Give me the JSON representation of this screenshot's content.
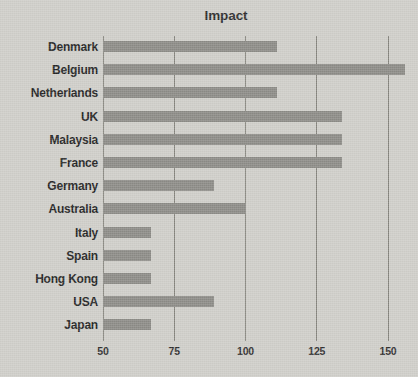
{
  "chart_data": {
    "type": "bar",
    "orientation": "horizontal",
    "title": "Impact",
    "xlabel": "",
    "ylabel": "",
    "xlim": [
      50,
      157
    ],
    "xticks": [
      50,
      75,
      100,
      125,
      150
    ],
    "xtick_labels": [
      "50",
      "75",
      "100",
      "125",
      "150"
    ],
    "grid": true,
    "grid_axis": "x",
    "legend": false,
    "bar_color": "#8b8a85",
    "background_color": "#cecdc8",
    "gridline_color": "#77766f",
    "text_color": "#232323",
    "categories": [
      "Denmark",
      "Belgium",
      "Netherlands",
      "UK",
      "Malaysia",
      "France",
      "Germany",
      "Australia",
      "Italy",
      "Spain",
      "Hong Kong",
      "USA",
      "Japan"
    ],
    "values": [
      111,
      156,
      111,
      134,
      134,
      134,
      89,
      100,
      67,
      67,
      67,
      89,
      67
    ],
    "bars": [
      {
        "label": "Denmark",
        "value": 111
      },
      {
        "label": "Belgium",
        "value": 156
      },
      {
        "label": "Netherlands",
        "value": 111
      },
      {
        "label": "UK",
        "value": 134
      },
      {
        "label": "Malaysia",
        "value": 134
      },
      {
        "label": "France",
        "value": 134
      },
      {
        "label": "Germany",
        "value": 89
      },
      {
        "label": "Australia",
        "value": 100
      },
      {
        "label": "Italy",
        "value": 67
      },
      {
        "label": "Spain",
        "value": 67
      },
      {
        "label": "Hong Kong",
        "value": 67
      },
      {
        "label": "USA",
        "value": 89
      },
      {
        "label": "Japan",
        "value": 67
      }
    ]
  }
}
